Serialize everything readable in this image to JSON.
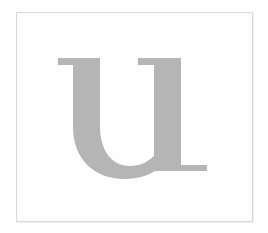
{
  "document": {
    "title": "Letter specimen",
    "type": "glyph-specimen-image"
  },
  "canvas": {
    "width": 268,
    "height": 233,
    "background_color": "#ffffff"
  },
  "frame": {
    "name": "image-border",
    "x": 16,
    "y": 12,
    "width": 237,
    "height": 210,
    "border_color": "#d8d8d8",
    "fill_color": "#fefefe"
  },
  "glyph": {
    "character": "u",
    "label": "lowercase letter u",
    "style": "serif",
    "case": "lowercase",
    "color": "#b5b5b5",
    "bounds": {
      "left": 57,
      "top": 57,
      "right": 205,
      "bottom": 178
    },
    "features": [
      "flat top serif on left stem",
      "flat top serif on right stem",
      "rounded bowl joining left stem to right stem",
      "bottom right serif foot"
    ]
  }
}
